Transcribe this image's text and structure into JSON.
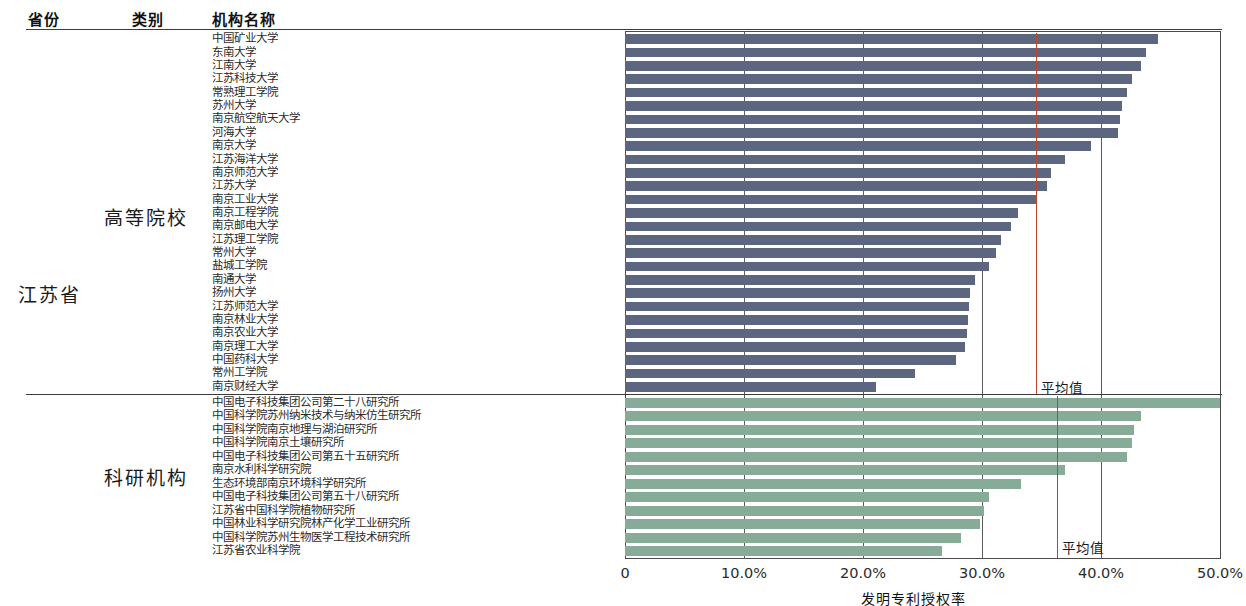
{
  "header": {
    "province_col": "省份",
    "category_col": "类别",
    "institution_col": "机构名称"
  },
  "province": "江苏省",
  "categories": {
    "university": "高等院校",
    "research": "科研机构"
  },
  "axis": {
    "title": "发明专利授权率",
    "ticks": [
      "0",
      "10.0%",
      "20.0%",
      "30.0%",
      "40.0%",
      "50.0%"
    ],
    "tick_values": [
      0,
      10,
      20,
      30,
      40,
      50
    ],
    "min": 0,
    "max": 50
  },
  "average_label": "平均值",
  "colors": {
    "university_bar": "#5c6680",
    "research_bar": "#86ac98",
    "average_line": "#c0452b",
    "axis": "#4a4a4a"
  },
  "chart_data": {
    "type": "bar",
    "orientation": "horizontal",
    "title": "发明专利授权率",
    "xlabel": "发明专利授权率",
    "ylabel": "",
    "xlim": [
      0,
      50
    ],
    "xticks": [
      0,
      10,
      20,
      30,
      40,
      50
    ],
    "xticklabels": [
      "0",
      "10.0%",
      "20.0%",
      "30.0%",
      "40.0%",
      "50.0%"
    ],
    "grid": true,
    "legend": "none",
    "units": "percent",
    "groups": [
      {
        "name": "高等院校",
        "color": "#5c6680",
        "average": 34.5,
        "average_label": "平均值",
        "categories": [
          "中国矿业大学",
          "东南大学",
          "江南大学",
          "江苏科技大学",
          "常熟理工学院",
          "苏州大学",
          "南京航空航天大学",
          "河海大学",
          "南京大学",
          "江苏海洋大学",
          "南京师范大学",
          "江苏大学",
          "南京工业大学",
          "南京工程学院",
          "南京邮电大学",
          "江苏理工学院",
          "常州大学",
          "盐城工学院",
          "南通大学",
          "扬州大学",
          "江苏师范大学",
          "南京林业大学",
          "南京农业大学",
          "南京理工大学",
          "中国药科大学",
          "常州工学院",
          "南京财经大学"
        ],
        "values": [
          44.8,
          43.8,
          43.4,
          42.6,
          42.2,
          41.8,
          41.6,
          41.4,
          39.2,
          37.0,
          35.8,
          35.5,
          34.6,
          33.0,
          32.4,
          31.6,
          31.2,
          30.6,
          29.4,
          29.0,
          28.9,
          28.8,
          28.7,
          28.6,
          27.8,
          24.4,
          21.1
        ]
      },
      {
        "name": "科研机构",
        "color": "#86ac98",
        "average": 36.3,
        "average_label": "平均值",
        "categories": [
          "中国电子科技集团公司第二十八研究所",
          "中国科学院苏州纳米技术与纳米仿生研究所",
          "中国科学院南京地理与湖泊研究所",
          "中国科学院南京土壤研究所",
          "中国电子科技集团公司第五十五研究所",
          "南京水利科学研究院",
          "生态环境部南京环境科学研究所",
          "中国电子科技集团公司第五十八研究所",
          "江苏省中国科学院植物研究所",
          "中国林业科学研究院林产化学工业研究所",
          "中国科学院苏州生物医学工程技术研究所",
          "江苏省农业科学院"
        ],
        "values": [
          50.0,
          43.4,
          42.8,
          42.6,
          42.2,
          37.0,
          33.3,
          30.6,
          30.2,
          29.8,
          28.2,
          26.6
        ]
      }
    ]
  }
}
